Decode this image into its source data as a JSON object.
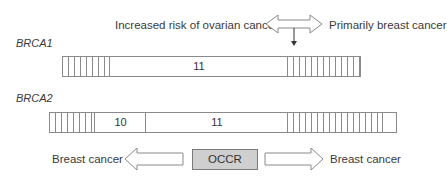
{
  "header": {
    "left_label": "Increased risk of ovarian cancer",
    "right_label": "Primarily breast cancer"
  },
  "genes": [
    {
      "name": "BRCA1",
      "exon_labels": [
        "11"
      ]
    },
    {
      "name": "BRCA2",
      "exon_labels": [
        "10",
        "11"
      ]
    }
  ],
  "footer": {
    "left_label": "Breast cancer",
    "center_label": "OCCR",
    "right_label": "Breast cancer"
  },
  "colors": {
    "outline": "#8a8a8a",
    "occr_fill": "#cfcfcf",
    "text": "#333333"
  }
}
